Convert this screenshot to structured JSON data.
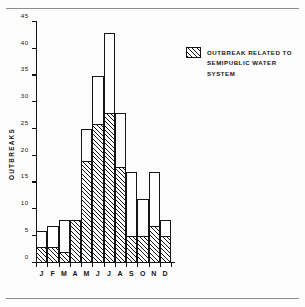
{
  "chart_data": {
    "type": "bar",
    "title": "",
    "xlabel": "",
    "ylabel": "OUTBREAKS",
    "categories": [
      "J",
      "F",
      "M",
      "A",
      "M",
      "J",
      "J",
      "A",
      "S",
      "O",
      "N",
      "D"
    ],
    "category_names": [
      "January",
      "February",
      "March",
      "April",
      "May",
      "June",
      "July",
      "August",
      "September",
      "October",
      "November",
      "December"
    ],
    "ylim": [
      0,
      45
    ],
    "yticks": [
      0,
      5,
      10,
      15,
      20,
      25,
      30,
      35,
      40,
      45
    ],
    "grid": false,
    "stacked": true,
    "legend_position": "right",
    "series": [
      {
        "name": "Total outbreaks",
        "style": "open",
        "values": [
          6,
          7,
          8,
          8,
          25,
          35,
          43,
          28,
          17,
          12,
          17,
          8
        ]
      },
      {
        "name": "OUTBREAK RELATED TO SEMIPUBLIC WATER SYSTEM",
        "style": "hatched",
        "values": [
          3,
          3,
          2,
          8,
          19,
          26,
          28,
          18,
          5,
          5,
          7,
          5
        ]
      }
    ],
    "annotations": []
  },
  "legend": {
    "label": "OUTBREAK RELATED TO\nSEMIPUBLIC WATER\nSYSTEM",
    "swatch": "hatched-swatch"
  },
  "colors": {
    "ink": "#141414",
    "background": "#fdfdfd",
    "rule": "#8d8d8d"
  }
}
